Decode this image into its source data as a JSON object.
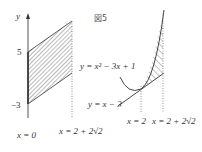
{
  "figure": {
    "title": "図5",
    "left_panel": {
      "axis_label": "y",
      "tick_labels": [
        "5",
        "−3"
      ],
      "boundary_labels": [
        "x = 0",
        "x = 2 + 2√2"
      ]
    },
    "right_panel": {
      "curve_label": "y = x² − 3x + 1",
      "line_label": "y = x − 3",
      "boundary_labels": [
        "x = 2",
        "x = 2 + 2√2"
      ]
    }
  }
}
